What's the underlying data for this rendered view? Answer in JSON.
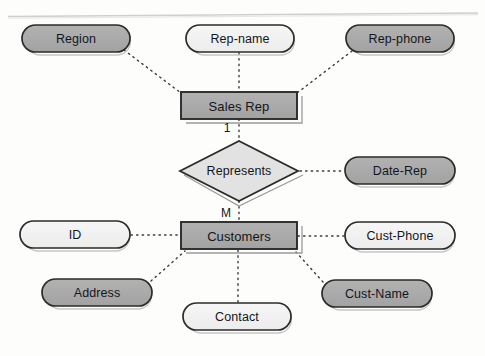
{
  "diagram": {
    "kind": "er-diagram",
    "background_color": "#fdfdfb",
    "fill_gray": "#a9a9a9",
    "fill_light": "#f1f1f1",
    "fill_diamond": "#e0e0e0",
    "stroke_color": "#2b2b2b",
    "connector_style": "dotted",
    "page_edge_line": true
  },
  "entities": [
    {
      "id": "sales-rep",
      "label": "Sales Rep",
      "shape": "rectangle",
      "fill": "gray",
      "x": 181,
      "y": 92,
      "w": 116,
      "h": 27,
      "cx": 239,
      "cy": 105.5
    },
    {
      "id": "customers",
      "label": "Customers",
      "shape": "rectangle",
      "fill": "gray",
      "x": 181,
      "y": 222,
      "w": 116,
      "h": 27,
      "cx": 239,
      "cy": 235.5
    }
  ],
  "relationships": [
    {
      "id": "represents",
      "label": "Represents",
      "shape": "diamond",
      "fill": "light-gray",
      "cx": 239,
      "cy": 171,
      "rx": 59,
      "ry": 30,
      "from": "sales-rep",
      "to": "customers",
      "cardinality_from": "1",
      "cardinality_to": "M"
    }
  ],
  "cardinality_labels": [
    {
      "id": "card-one",
      "text": "1",
      "cx": 227,
      "cy": 128
    },
    {
      "id": "card-many",
      "text": "M",
      "cx": 226,
      "cy": 213
    }
  ],
  "attributes": [
    {
      "id": "region",
      "label": "Region",
      "fill": "gray",
      "owner": "sales-rep",
      "x": 22,
      "y": 25,
      "w": 108,
      "h": 27,
      "cx": 76,
      "cy": 38.5,
      "link_from": [
        124,
        50
      ],
      "link_to": [
        181,
        93
      ]
    },
    {
      "id": "rep-name",
      "label": "Rep-name",
      "fill": "light",
      "owner": "sales-rep",
      "x": 186,
      "y": 25,
      "w": 108,
      "h": 27,
      "cx": 240,
      "cy": 38.5,
      "link_from": [
        239,
        53
      ],
      "link_to": [
        239,
        92
      ]
    },
    {
      "id": "rep-phone",
      "label": "Rep-phone",
      "fill": "gray",
      "owner": "sales-rep",
      "x": 346,
      "y": 25,
      "w": 108,
      "h": 27,
      "cx": 400,
      "cy": 38.5,
      "link_from": [
        352,
        51
      ],
      "link_to": [
        297,
        93
      ]
    },
    {
      "id": "date-rep",
      "label": "Date-Rep",
      "fill": "gray",
      "owner": "represents",
      "x": 345,
      "y": 157,
      "w": 110,
      "h": 27,
      "cx": 400,
      "cy": 170.5,
      "link_from": [
        344,
        171
      ],
      "link_to": [
        299,
        171
      ]
    },
    {
      "id": "id",
      "label": "ID",
      "fill": "light",
      "owner": "customers",
      "x": 20,
      "y": 221,
      "w": 110,
      "h": 27,
      "cx": 75,
      "cy": 234.5,
      "link_from": [
        131,
        235
      ],
      "link_to": [
        181,
        235
      ]
    },
    {
      "id": "cust-phone",
      "label": "Cust-Phone",
      "fill": "light",
      "owner": "customers",
      "x": 345,
      "y": 222,
      "w": 110,
      "h": 27,
      "cx": 400,
      "cy": 235.5,
      "link_from": [
        344,
        236
      ],
      "link_to": [
        299,
        236
      ]
    },
    {
      "id": "address",
      "label": "Address",
      "fill": "gray",
      "owner": "customers",
      "x": 42,
      "y": 279,
      "w": 110,
      "h": 27,
      "cx": 97,
      "cy": 292.5,
      "link_from": [
        151,
        281
      ],
      "link_to": [
        184,
        251
      ]
    },
    {
      "id": "cust-name",
      "label": "Cust-Name",
      "fill": "gray",
      "owner": "customers",
      "x": 322,
      "y": 280,
      "w": 110,
      "h": 27,
      "cx": 377,
      "cy": 293.5,
      "link_from": [
        323,
        282
      ],
      "link_to": [
        296,
        252
      ]
    },
    {
      "id": "contact",
      "label": "Contact",
      "fill": "light",
      "owner": "customers",
      "x": 183,
      "y": 303,
      "w": 108,
      "h": 27,
      "cx": 237,
      "cy": 316.5,
      "link_from": [
        238,
        302
      ],
      "link_to": [
        238,
        250
      ]
    }
  ]
}
